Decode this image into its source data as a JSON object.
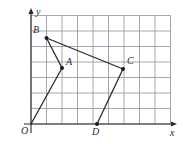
{
  "figure": {
    "kind": "coordinate-geometry-figure",
    "background_color": "#ffffff",
    "grid": {
      "visible": true,
      "line_color": "#8f8f9c",
      "line_width": 0.8,
      "columns": 9,
      "rows": 7,
      "cell_px": 15.5,
      "left_px": 31,
      "bottom_px": 124,
      "top_px": 15.5,
      "right_px": 170.5
    },
    "axes": {
      "color": "#2b2b2b",
      "x_axis": {
        "label": "x",
        "label_x": 170,
        "label_y": 128,
        "arrow": true,
        "y_px": 124,
        "x_start_px": 24,
        "x_end_px": 177
      },
      "y_axis": {
        "label": "y",
        "label_x": 36,
        "label_y": 7,
        "arrow": true,
        "x_px": 31,
        "y_start_px": 133,
        "y_end_px": 8
      },
      "origin": {
        "label": "O",
        "label_x": 21,
        "label_y": 126,
        "x_px": 31,
        "y_px": 124
      }
    },
    "points": [
      {
        "name": "A",
        "grid_x": 2.0,
        "grid_y": 3.6,
        "px_x": 62,
        "px_y": 68,
        "label": "A",
        "label_x": 66,
        "label_y": 57,
        "marker": "filled-dot"
      },
      {
        "name": "B",
        "grid_x": 1.0,
        "grid_y": 5.55,
        "px_x": 46.5,
        "px_y": 38,
        "label": "B",
        "label_x": 33,
        "label_y": 25,
        "marker": "filled-dot"
      },
      {
        "name": "C",
        "grid_x": 5.95,
        "grid_y": 3.55,
        "px_x": 123,
        "px_y": 69,
        "label": "C",
        "label_x": 127,
        "label_y": 56,
        "marker": "filled-dot"
      },
      {
        "name": "D",
        "grid_x": 4.25,
        "grid_y": 0.0,
        "px_x": 97,
        "px_y": 124,
        "label": "D",
        "label_x": 92,
        "label_y": 127,
        "marker": "filled-dot"
      }
    ],
    "segments": [
      {
        "name": "segment-B-A",
        "from": "B",
        "to": "A"
      },
      {
        "name": "segment-B-C",
        "from": "B",
        "to": "C"
      },
      {
        "name": "segment-A-O",
        "from": "A",
        "to": "O"
      },
      {
        "name": "segment-C-D",
        "from": "C",
        "to": "D"
      }
    ],
    "stroke": {
      "segment_color": "#2b2b2b",
      "segment_width": 1.3,
      "dot_radius": 2.0,
      "dot_color": "#1c1c1c"
    }
  }
}
